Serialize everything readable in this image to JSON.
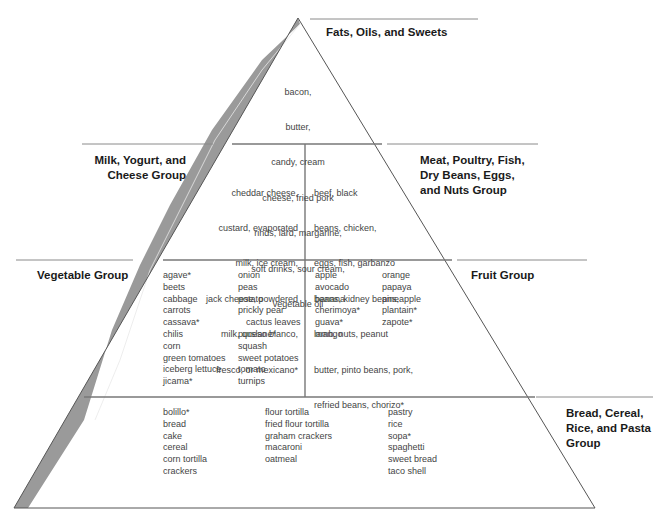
{
  "colors": {
    "outline": "#555555",
    "shaded_band": "#9a9a9a",
    "label_line": "#8a8a8a",
    "label_text": "#1a1a1a",
    "food_text": "#444444"
  },
  "groups": {
    "fats": {
      "label": "Fats, Oils, and Sweets",
      "foods_text": [
        "bacon,",
        "butter,",
        "candy, cream",
        "cheese, fried pork",
        "rinds, lard, margarine,",
        "soft drinks, sour cream,",
        "vegetable oil"
      ]
    },
    "milk": {
      "label_lines": [
        "Milk, Yogurt, and",
        "Cheese Group"
      ],
      "foods_text": [
        "cheddar cheese,",
        "custard, evaporated",
        "milk, ice cream,",
        "jack cheese, powdered",
        "milk, queso blanco,",
        "fresco, or mexicano*"
      ]
    },
    "meat": {
      "label_lines": [
        "Meat, Poultry, Fish,",
        "Dry Beans, Eggs,",
        "and Nuts Group"
      ],
      "foods_text": [
        "beef, black",
        "beans, chicken,",
        "eggs, fish, garbanzo",
        "beans, kidney beans,",
        "lamb, nuts, peanut",
        "butter, pinto beans, pork,",
        "refried beans, chorizo*"
      ]
    },
    "vegetable": {
      "label": "Vegetable Group",
      "col1": [
        "agave*",
        "beets",
        "cabbage",
        "carrots",
        "cassava*",
        "chilis",
        "corn",
        "green tomatoes",
        "iceberg lettuce",
        "jicama*"
      ],
      "col2": [
        "onion",
        "peas",
        "potato",
        "prickly pear",
        "cactus leaves",
        "purslane*",
        "squash",
        "sweet potatoes",
        "tomato",
        "turnips"
      ]
    },
    "fruit": {
      "label": "Fruit Group",
      "col1": [
        "apple",
        "avocado",
        "banana",
        "cherimoya*",
        "guava*",
        "mango"
      ],
      "col2": [
        "orange",
        "papaya",
        "pineapple",
        "plantain*",
        "zapote*"
      ]
    },
    "bread": {
      "label_lines": [
        "Bread, Cereal,",
        "Rice, and Pasta",
        "Group"
      ],
      "col1": [
        "bolillo*",
        "bread",
        "cake",
        "cereal",
        "corn tortilla",
        "crackers"
      ],
      "col2": [
        "flour tortilla",
        "fried flour tortilla",
        "graham crackers",
        "macaroni",
        "oatmeal"
      ],
      "col3": [
        "pastry",
        "rice",
        "sopa*",
        "spaghetti",
        "sweet bread",
        "taco shell"
      ]
    }
  }
}
